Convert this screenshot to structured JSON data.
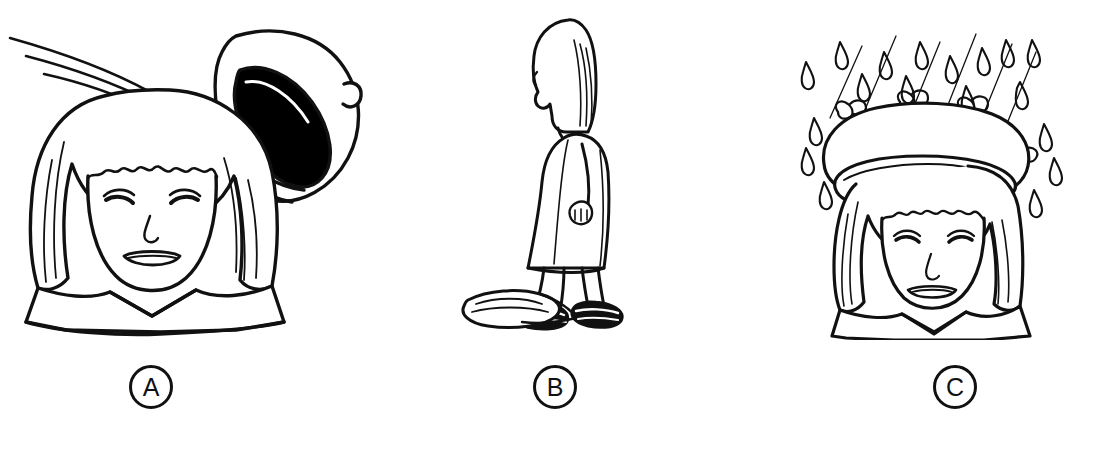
{
  "illustration": {
    "title": "Three-panel line drawing sequence of a girl and her hat",
    "style": "black ink line art on white background",
    "background_color": "#ffffff",
    "ink_color": "#111111",
    "panel_count": 3
  },
  "panels": [
    {
      "id": "A",
      "label": "A",
      "label_shape": "circle",
      "scene_name": "hat-blowing-off",
      "description": "Front view of a girl's head with a straight bob haircut and blunt bangs; a beret is lifting off her head and tumbling away to the upper right, with motion/wind lines trailing to the upper left. The inside of the beret is shaded solid black.",
      "subjects": [
        "girl-head-front",
        "beret-flying",
        "wind-motion-lines"
      ]
    },
    {
      "id": "B",
      "label": "B",
      "label_shape": "circle",
      "scene_name": "girl-walking-past-hat",
      "description": "Full-body profile of the girl walking to the left in a sleeveless dress, hands clasped behind her back, wearing dark strapped sandals. The flattened beret lies on the ground in front of her feet.",
      "subjects": [
        "girl-walking-profile",
        "dress",
        "dark-sandals",
        "beret-on-ground"
      ]
    },
    {
      "id": "C",
      "label": "C",
      "label_shape": "circle",
      "scene_name": "girl-wearing-hat-in-rain",
      "description": "Front view of the same girl now wearing the large beret, with small bow loops around its brim, while rain falls around her; teardrop shapes and thin diagonal streak lines indicate rainfall.",
      "subjects": [
        "girl-head-front",
        "beret-worn",
        "raindrops",
        "rain-streaks"
      ]
    }
  ],
  "colors": {
    "background": "#ffffff",
    "ink": "#111111",
    "fill_dark": "#000000",
    "label_stroke": "#111111"
  }
}
